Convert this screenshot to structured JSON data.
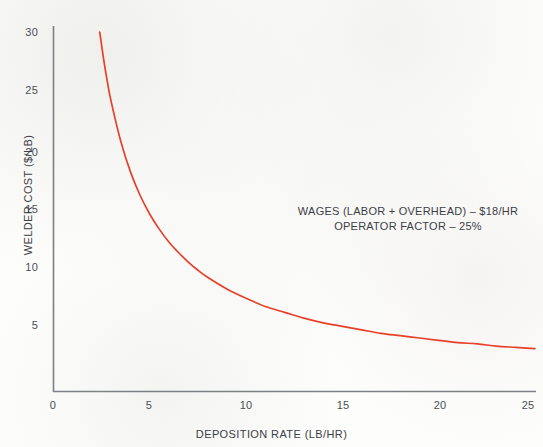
{
  "chart_data": {
    "type": "line",
    "title": "",
    "xlabel": "DEPOSITION RATE (LB/HR)",
    "ylabel": "WELDER COST ($/LB)",
    "xlim": [
      0,
      25
    ],
    "ylim": [
      0,
      30
    ],
    "grid": false,
    "legend": null,
    "series": [
      {
        "name": "Welder cost vs deposition rate",
        "color": "#e8402a",
        "formula": "cost = wages / (operator_factor * deposition_rate) = 72 / rate",
        "x": [
          2.4,
          2.6,
          2.8,
          3,
          3.5,
          4,
          4.5,
          5,
          5.5,
          6,
          6.5,
          7,
          7.5,
          8,
          9,
          10,
          11,
          12,
          13,
          14,
          15,
          16,
          17,
          18,
          19,
          20,
          21,
          22,
          23,
          24,
          25
        ],
        "y": [
          30,
          27.7,
          25.7,
          24,
          20.6,
          18,
          16,
          14.4,
          13.1,
          12,
          11.1,
          10.3,
          9.6,
          9,
          8,
          7.2,
          6.5,
          6,
          5.5,
          5.1,
          4.8,
          4.5,
          4.2,
          4,
          3.8,
          3.6,
          3.4,
          3.3,
          3.1,
          3,
          2.9
        ]
      }
    ],
    "x_ticks": [
      {
        "value": 0,
        "label": "0"
      },
      {
        "value": 5,
        "label": "5"
      },
      {
        "value": 10,
        "label": "10"
      },
      {
        "value": 15,
        "label": "15"
      },
      {
        "value": 20,
        "label": "20"
      },
      {
        "value": 25,
        "label": "25"
      }
    ],
    "y_ticks": [
      {
        "value": 5,
        "label": "5"
      },
      {
        "value": 10,
        "label": "10"
      },
      {
        "value": 15,
        "label": "15"
      },
      {
        "value": 20,
        "label": "20"
      },
      {
        "value": 25,
        "label": "25"
      },
      {
        "value": 30,
        "label": "30"
      }
    ],
    "annotations": [
      "WAGES (LABOR + OVERHEAD) – $18/HR",
      "OPERATOR FACTOR – 25%"
    ],
    "annotation_values": {
      "wages_per_hour": "$18/HR",
      "operator_factor": "25%"
    },
    "colors": {
      "curve": "#e8402a",
      "axis": "#7c8086",
      "text": "#3c4046",
      "background": "#fdfdfc"
    }
  }
}
